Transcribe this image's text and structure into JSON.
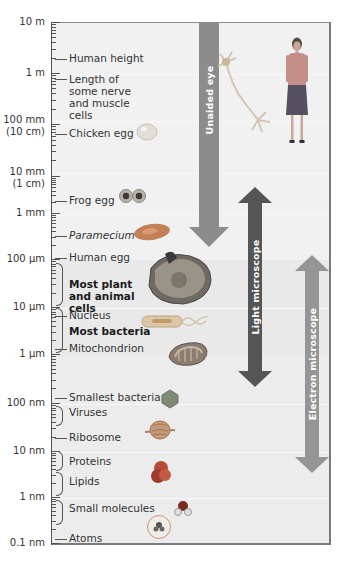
{
  "chart_data": {
    "type": "scale-diagram",
    "title": "",
    "axis": {
      "scale": "logarithmic",
      "ticks": [
        "10 m",
        "1 m",
        "100 mm (10 cm)",
        "10 mm (1 cm)",
        "1 mm",
        "100 µm",
        "10 µm",
        "1 µm",
        "100 nm",
        "10 nm",
        "1 nm",
        "0.1 nm"
      ]
    },
    "items": [
      {
        "label": "Human height",
        "approx_size": "~1.7 m"
      },
      {
        "label": "Length of some nerve and muscle cells",
        "approx_size": "~0.5 m"
      },
      {
        "label": "Chicken egg",
        "approx_size": "~5 cm"
      },
      {
        "label": "Frog egg",
        "approx_size": "~2 mm"
      },
      {
        "label": "Paramecium",
        "approx_size": "~200 µm"
      },
      {
        "label": "Human egg",
        "approx_size": "~100 µm"
      },
      {
        "label": "Most plant and animal cells",
        "approx_size": "10–100 µm"
      },
      {
        "label": "Nucleus",
        "approx_size": "~8 µm"
      },
      {
        "label": "Most bacteria",
        "approx_size": "1–10 µm"
      },
      {
        "label": "Mitochondrion",
        "approx_size": "~1.5 µm"
      },
      {
        "label": "Smallest bacteria",
        "approx_size": "~150 nm"
      },
      {
        "label": "Viruses",
        "approx_size": "~50–100 nm"
      },
      {
        "label": "Ribosome",
        "approx_size": "~25 nm"
      },
      {
        "label": "Proteins",
        "approx_size": "~5–10 nm"
      },
      {
        "label": "Lipids",
        "approx_size": "~2–5 nm"
      },
      {
        "label": "Small molecules",
        "approx_size": "~0.5–1 nm"
      },
      {
        "label": "Atoms",
        "approx_size": "~0.1 nm"
      }
    ],
    "ranges": [
      {
        "label": "Unaided eye",
        "from": "10 m",
        "to": "~100 µm"
      },
      {
        "label": "Light microscope",
        "from": "~1 mm",
        "to": "~200 nm"
      },
      {
        "label": "Electron microscope",
        "from": "~100 µm",
        "to": "~2 nm"
      }
    ]
  },
  "axis_labels": {
    "t10m": "10 m",
    "t1m": "1 m",
    "t100mm": "100 mm",
    "t10cm": "(10 cm)",
    "t10mm": "10 mm",
    "t1cm": "(1 cm)",
    "t1mm": "1 mm",
    "t100um": "100 µm",
    "t10um": "10 µm",
    "t1um": "1 µm",
    "t100nm": "100 nm",
    "t10nm": "10 nm",
    "t1nm": "1 nm",
    "t01nm": "0.1 nm"
  },
  "items": {
    "human_height": "Human height",
    "nerve_cells": "Length of some nerve and muscle cells",
    "chicken_egg": "Chicken egg",
    "frog_egg": "Frog egg",
    "paramecium": "Paramecium",
    "human_egg": "Human egg",
    "plant_animal_cells": "Most plant and animal cells",
    "nucleus": "Nucleus",
    "most_bacteria": "Most bacteria",
    "mitochondrion": "Mitochondrion",
    "smallest_bacteria": "Smallest bacteria",
    "viruses": "Viruses",
    "ribosome": "Ribosome",
    "proteins": "Proteins",
    "lipids": "Lipids",
    "small_molecules": "Small molecules",
    "atoms": "Atoms"
  },
  "arrows": {
    "unaided_eye": "Unaided eye",
    "light_microscope": "Light microscope",
    "electron_microscope": "Electron microscope"
  },
  "colors": {
    "unaided_eye": "#8c8c8c",
    "light_microscope": "#555555",
    "electron_microscope": "#959595"
  }
}
